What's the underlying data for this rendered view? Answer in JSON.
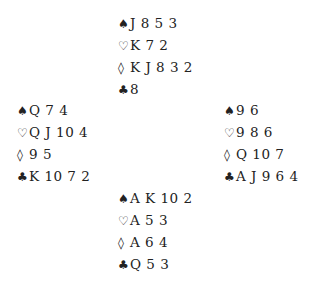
{
  "hands": {
    "north": {
      "spades": {
        "symbol": "♠",
        "cards": "J 8 5 3"
      },
      "hearts": {
        "symbol": "♡",
        "cards": "K 7 2"
      },
      "diamonds": {
        "symbol": "◊",
        "cards": "K J 8 3 2"
      },
      "clubs": {
        "symbol": "♣",
        "cards": "8"
      }
    },
    "west": {
      "spades": {
        "symbol": "♠",
        "cards": "Q 7 4"
      },
      "hearts": {
        "symbol": "♡",
        "cards": "Q J 10 4"
      },
      "diamonds": {
        "symbol": "◊",
        "cards": "9 5"
      },
      "clubs": {
        "symbol": "♣",
        "cards": "K 10 7 2"
      }
    },
    "east": {
      "spades": {
        "symbol": "♠",
        "cards": "9 6"
      },
      "hearts": {
        "symbol": "♡",
        "cards": "9 8 6"
      },
      "diamonds": {
        "symbol": "◊",
        "cards": "Q 10 7"
      },
      "clubs": {
        "symbol": "♣",
        "cards": "A J 9 6 4"
      }
    },
    "south": {
      "spades": {
        "symbol": "♠",
        "cards": "A K 10 2"
      },
      "hearts": {
        "symbol": "♡",
        "cards": "A 5 3"
      },
      "diamonds": {
        "symbol": "◊",
        "cards": "A 6 4"
      },
      "clubs": {
        "symbol": "♣",
        "cards": "Q 5 3"
      }
    }
  }
}
